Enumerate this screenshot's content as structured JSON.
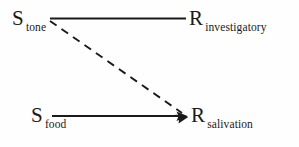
{
  "diagram": {
    "background_color": "#fefefe",
    "ink_color": "#1a1a1a",
    "nodes": [
      {
        "id": "s-tone",
        "main": "S",
        "subscript": "tone",
        "role": "conditioned-stimulus"
      },
      {
        "id": "r-investigatory",
        "main": "R",
        "subscript": "investigatory",
        "role": "unconditioned-response"
      },
      {
        "id": "s-food",
        "main": "S",
        "subscript": "food",
        "role": "unconditioned-stimulus"
      },
      {
        "id": "r-salivation",
        "main": "R",
        "subscript": "salivation",
        "role": "response"
      }
    ],
    "connectors": [
      {
        "id": "tone-to-investigatory",
        "from": "s-tone",
        "to": "r-investigatory",
        "style": "solid",
        "arrowhead": "none"
      },
      {
        "id": "food-to-salivation",
        "from": "s-food",
        "to": "r-salivation",
        "style": "solid",
        "arrowhead": "end"
      },
      {
        "id": "tone-to-salivation",
        "from": "s-tone",
        "to": "r-salivation",
        "style": "dashed",
        "arrowhead": "end"
      }
    ]
  }
}
